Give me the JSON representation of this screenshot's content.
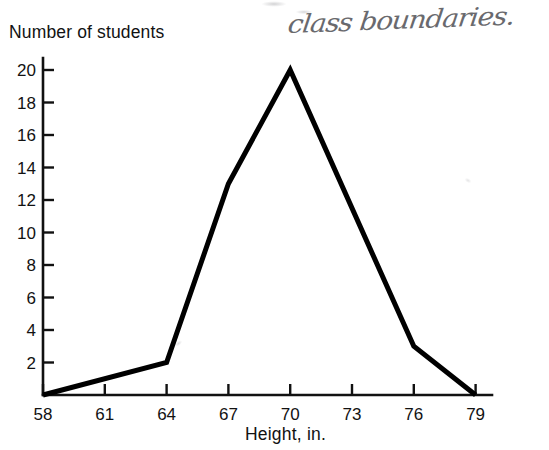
{
  "annotation": {
    "handwritten_note": "class boundaries."
  },
  "chart_data": {
    "type": "line",
    "title": "",
    "xlabel": "Height, in.",
    "ylabel": "Number of students",
    "x": [
      58,
      61,
      64,
      67,
      70,
      73,
      76,
      79
    ],
    "xtick_labels": [
      "58",
      "61",
      "64",
      "67",
      "70",
      "73",
      "76",
      "79"
    ],
    "ytick_labels": [
      "2",
      "4",
      "6",
      "8",
      "10",
      "12",
      "14",
      "16",
      "18",
      "20"
    ],
    "ytick_values": [
      2,
      4,
      6,
      8,
      10,
      12,
      14,
      16,
      18,
      20
    ],
    "xlim": [
      58,
      80
    ],
    "ylim": [
      0,
      21
    ],
    "grid": false,
    "legend": null,
    "line_color": "#000000",
    "points": [
      {
        "x": 58,
        "y": 0
      },
      {
        "x": 64,
        "y": 2
      },
      {
        "x": 67,
        "y": 13
      },
      {
        "x": 70,
        "y": 20
      },
      {
        "x": 76,
        "y": 3
      },
      {
        "x": 79,
        "y": 0
      }
    ],
    "values": [
      0,
      null,
      2,
      13,
      20,
      null,
      3,
      0
    ]
  }
}
